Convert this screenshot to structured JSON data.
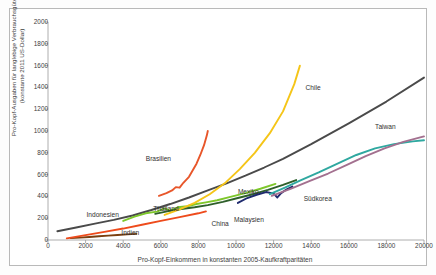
{
  "chart_data": {
    "type": "line",
    "title": "",
    "xlabel": "Pro-Kopf-Einkommen in konstanten 2005-Kaufkraftparitäten",
    "ylabel": "Pro-Kopf-Ausgaben für langlebige Verbrauchsgüter (konstante 2011 US-Dollar)",
    "xlim": [
      0,
      20000
    ],
    "ylim": [
      0,
      2000
    ],
    "xticks": [
      0,
      2000,
      4000,
      6000,
      8000,
      10000,
      12000,
      14000,
      16000,
      18000,
      20000
    ],
    "yticks": [
      0,
      200,
      400,
      600,
      800,
      1000,
      1200,
      1400,
      1600,
      1800,
      2000
    ],
    "grid": false,
    "legend": "inline-annotations",
    "series": [
      {
        "name": "Indien",
        "label": "Indien",
        "color": "#7b3f10",
        "label_x": 3900,
        "label_y": 60,
        "points": [
          [
            1200,
            18
          ],
          [
            1700,
            22
          ],
          [
            2200,
            28
          ],
          [
            2700,
            34
          ],
          [
            3200,
            40
          ],
          [
            3700,
            46
          ],
          [
            4200,
            52
          ],
          [
            4700,
            56
          ]
        ]
      },
      {
        "name": "China",
        "label": "China",
        "color": "#ee4b1c",
        "label_x": 8700,
        "label_y": 148,
        "points": [
          [
            1000,
            15
          ],
          [
            2000,
            45
          ],
          [
            3000,
            75
          ],
          [
            4000,
            105
          ],
          [
            5000,
            140
          ],
          [
            6000,
            175
          ],
          [
            7000,
            210
          ],
          [
            8000,
            245
          ],
          [
            8400,
            262
          ]
        ]
      },
      {
        "name": "Indonesien",
        "label": "Indonesien",
        "color": "#4a4a4a",
        "label_x": 2050,
        "label_y": 225,
        "points": [
          [
            500,
            80
          ],
          [
            1500,
            115
          ],
          [
            2500,
            150
          ],
          [
            3500,
            185
          ],
          [
            4500,
            225
          ],
          [
            5500,
            275
          ],
          [
            6500,
            330
          ],
          [
            7500,
            390
          ],
          [
            8500,
            455
          ],
          [
            9500,
            520
          ],
          [
            10500,
            590
          ],
          [
            11500,
            665
          ],
          [
            12500,
            745
          ],
          [
            14000,
            880
          ],
          [
            16000,
            1070
          ],
          [
            18000,
            1270
          ],
          [
            20000,
            1490
          ]
        ]
      },
      {
        "name": "Thailand",
        "label": "Thailand",
        "color": "#7ec72b",
        "label_x": 5600,
        "label_y": 285,
        "points": [
          [
            4000,
            175
          ],
          [
            4600,
            215
          ],
          [
            5200,
            245
          ],
          [
            5800,
            260
          ],
          [
            6200,
            290
          ],
          [
            6500,
            270
          ],
          [
            6900,
            300
          ],
          [
            7400,
            310
          ],
          [
            7900,
            330
          ],
          [
            8400,
            345
          ],
          [
            9000,
            365
          ],
          [
            9700,
            395
          ],
          [
            10500,
            430
          ],
          [
            11300,
            470
          ],
          [
            12100,
            515
          ]
        ]
      },
      {
        "name": "Malaysien",
        "label": "Malaysien",
        "color": "#2e5f2a",
        "label_x": 9900,
        "label_y": 185,
        "points": [
          [
            5700,
            240
          ],
          [
            6400,
            265
          ],
          [
            7100,
            285
          ],
          [
            7800,
            300
          ],
          [
            8500,
            320
          ],
          [
            9300,
            350
          ],
          [
            10100,
            385
          ],
          [
            10900,
            420
          ],
          [
            11700,
            460
          ],
          [
            12500,
            505
          ],
          [
            13200,
            550
          ]
        ]
      },
      {
        "name": "Brasilien",
        "label": "Brasilien",
        "color": "#e8562a",
        "label_x": 5200,
        "label_y": 745,
        "points": [
          [
            5900,
            405
          ],
          [
            6300,
            430
          ],
          [
            6600,
            455
          ],
          [
            6800,
            485
          ],
          [
            7000,
            480
          ],
          [
            7200,
            525
          ],
          [
            7500,
            580
          ],
          [
            7700,
            640
          ],
          [
            7900,
            700
          ],
          [
            8100,
            780
          ],
          [
            8300,
            870
          ],
          [
            8450,
            960
          ],
          [
            8500,
            1000
          ]
        ]
      },
      {
        "name": "Chile",
        "label": "Chile",
        "color": "#f5c518",
        "label_x": 13700,
        "label_y": 1395,
        "points": [
          [
            6200,
            230
          ],
          [
            7000,
            280
          ],
          [
            7800,
            340
          ],
          [
            8600,
            420
          ],
          [
            9400,
            520
          ],
          [
            10200,
            650
          ],
          [
            11000,
            800
          ],
          [
            11800,
            980
          ],
          [
            12500,
            1180
          ],
          [
            13100,
            1430
          ],
          [
            13400,
            1600
          ]
        ]
      },
      {
        "name": "Mexiko",
        "label": "Mexiko",
        "color": "#1f2a6e",
        "label_x": 10100,
        "label_y": 440,
        "points": [
          [
            10100,
            340
          ],
          [
            10600,
            385
          ],
          [
            11100,
            415
          ],
          [
            11600,
            440
          ],
          [
            12000,
            425
          ],
          [
            12200,
            390
          ],
          [
            12400,
            430
          ],
          [
            12700,
            465
          ],
          [
            13000,
            490
          ]
        ]
      },
      {
        "name": "Südkorea",
        "label": "Südkorea",
        "color": "#2fa8a0",
        "label_x": 13600,
        "label_y": 375,
        "points": [
          [
            11800,
            420
          ],
          [
            12600,
            480
          ],
          [
            13400,
            545
          ],
          [
            14400,
            620
          ],
          [
            15400,
            700
          ],
          [
            16400,
            780
          ],
          [
            17400,
            840
          ],
          [
            18400,
            880
          ],
          [
            19400,
            905
          ],
          [
            20000,
            915
          ]
        ]
      },
      {
        "name": "Taiwan",
        "label": "Taiwan",
        "color": "#a3708f",
        "label_x": 17400,
        "label_y": 1040,
        "points": [
          [
            11900,
            405
          ],
          [
            12900,
            470
          ],
          [
            13900,
            540
          ],
          [
            14900,
            610
          ],
          [
            15900,
            690
          ],
          [
            16900,
            770
          ],
          [
            17900,
            840
          ],
          [
            18900,
            900
          ],
          [
            20000,
            950
          ]
        ]
      }
    ]
  }
}
